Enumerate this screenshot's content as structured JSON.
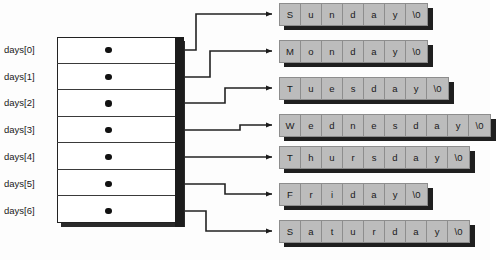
{
  "diagram": {
    "colors": {
      "page_background": "#fdfdfd",
      "array_fill": "#ffffff",
      "array_border": "#222222",
      "array_edge_shadow": "#1c1c1c",
      "string_cell_fill": "#bcbcbc",
      "string_cell_border": "#8d8d8d",
      "string_shadow": "#1f1f1f",
      "wire": "#222222",
      "pointer_dot": "#111111",
      "text": "#1a1a1a"
    },
    "array": {
      "name": "days",
      "cell_count": 7,
      "cells": [
        {
          "label": "days[0]",
          "points_to": "Sunday"
        },
        {
          "label": "days[1]",
          "points_to": "Monday"
        },
        {
          "label": "days[2]",
          "points_to": "Tuesday"
        },
        {
          "label": "days[3]",
          "points_to": "Wednesday"
        },
        {
          "label": "days[4]",
          "points_to": "Thursday"
        },
        {
          "label": "days[5]",
          "points_to": "Friday"
        },
        {
          "label": "days[6]",
          "points_to": "Saturday"
        }
      ]
    },
    "strings": [
      {
        "name": "sunday-string",
        "chars": [
          "S",
          "u",
          "n",
          "d",
          "a",
          "y",
          "\\0"
        ]
      },
      {
        "name": "monday-string",
        "chars": [
          "M",
          "o",
          "n",
          "d",
          "a",
          "y",
          "\\0"
        ]
      },
      {
        "name": "tuesday-string",
        "chars": [
          "T",
          "u",
          "e",
          "s",
          "d",
          "a",
          "y",
          "\\0"
        ]
      },
      {
        "name": "wednesday-string",
        "chars": [
          "W",
          "e",
          "d",
          "n",
          "e",
          "s",
          "d",
          "a",
          "y",
          "\\0"
        ]
      },
      {
        "name": "thursday-string",
        "chars": [
          "T",
          "h",
          "u",
          "r",
          "s",
          "d",
          "a",
          "y",
          "\\0"
        ]
      },
      {
        "name": "friday-string",
        "chars": [
          "F",
          "r",
          "i",
          "d",
          "a",
          "y",
          "\\0"
        ]
      },
      {
        "name": "saturday-string",
        "chars": [
          "S",
          "a",
          "t",
          "u",
          "r",
          "d",
          "a",
          "y",
          "\\0"
        ]
      }
    ]
  }
}
